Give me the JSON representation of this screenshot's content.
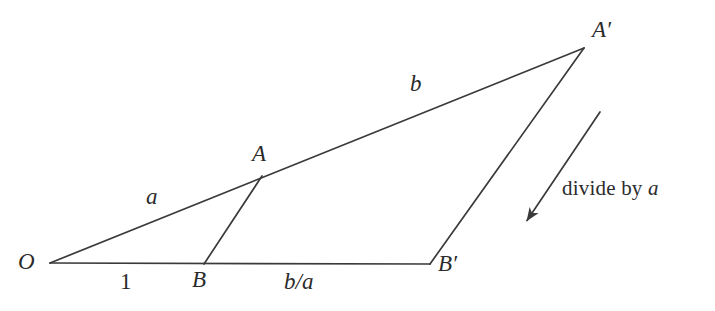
{
  "figure": {
    "background_color": "#ffffff",
    "stroke_color": "#3a3a3a",
    "text_color": "#2b2b2b",
    "width": 715,
    "height": 311
  },
  "points": {
    "O": {
      "label": "O",
      "x": 50,
      "y": 263
    },
    "A": {
      "label": "A",
      "x": 262,
      "y": 176
    },
    "B": {
      "label": "B",
      "x": 204,
      "y": 264
    },
    "A_prime": {
      "label": "A′",
      "x": 584,
      "y": 48
    },
    "B_prime": {
      "label": "B′",
      "x": 430,
      "y": 264
    }
  },
  "point_labels": {
    "O": {
      "text": "O",
      "x": 18,
      "y": 250
    },
    "A": {
      "text": "A",
      "x": 252,
      "y": 142
    },
    "B": {
      "text": "B",
      "x": 192,
      "y": 268
    },
    "A_prime": {
      "text": "A′",
      "x": 592,
      "y": 18
    },
    "B_prime": {
      "text": "B′",
      "x": 438,
      "y": 252
    }
  },
  "segments": [
    {
      "name": "ray-O-to-Aprime",
      "from": "O",
      "to": "A_prime"
    },
    {
      "name": "base-O-to-Bprime",
      "from": "O",
      "to": "B_prime"
    },
    {
      "name": "side-A-to-B",
      "from": "A",
      "to": "B"
    },
    {
      "name": "side-Aprime-to-Bprime",
      "from": "A_prime",
      "to": "B_prime"
    }
  ],
  "length_labels": {
    "a": {
      "text": "a",
      "x": 146,
      "y": 185,
      "segment": "O-A"
    },
    "b": {
      "text": "b",
      "x": 410,
      "y": 72,
      "segment": "A-Aprime"
    },
    "one": {
      "text": "1",
      "x": 120,
      "y": 270,
      "segment": "O-B"
    },
    "b_over_a": {
      "text": "b/a",
      "x": 284,
      "y": 270,
      "segment": "B-Bprime"
    }
  },
  "annotation": {
    "text_prefix": "divide by ",
    "text_variable": "a",
    "full_text": "divide by a",
    "x": 562,
    "y": 178,
    "arrow": {
      "name": "divide-by-a-arrow",
      "tail_x": 600,
      "tail_y": 112,
      "head_x": 522,
      "head_y": 228
    }
  }
}
